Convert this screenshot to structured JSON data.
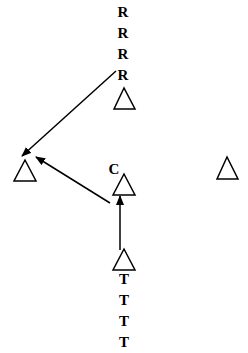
{
  "diagram": {
    "background": "#ffffff",
    "stroke_color": "#000000",
    "nodes": [
      {
        "id": "top",
        "shape": "triangle",
        "labels_above": [
          "R",
          "R",
          "R",
          "R"
        ],
        "labels_below": []
      },
      {
        "id": "left",
        "shape": "triangle",
        "labels_above": [],
        "labels_below": []
      },
      {
        "id": "middle",
        "shape": "triangle",
        "labels_above": [
          "C"
        ],
        "labels_below": []
      },
      {
        "id": "right",
        "shape": "triangle",
        "labels_above": [],
        "labels_below": []
      },
      {
        "id": "bottom",
        "shape": "triangle",
        "labels_above": [],
        "labels_below": [
          "T",
          "T",
          "T",
          "T"
        ]
      }
    ],
    "edges": [
      {
        "from": "top",
        "to": "left"
      },
      {
        "from": "middle",
        "to": "left"
      },
      {
        "from": "bottom",
        "to": "middle"
      }
    ],
    "labels": {
      "r1": "R",
      "r2": "R",
      "r3": "R",
      "r4": "R",
      "c": "C",
      "t1": "T",
      "t2": "T",
      "t3": "T",
      "t4": "T"
    }
  }
}
